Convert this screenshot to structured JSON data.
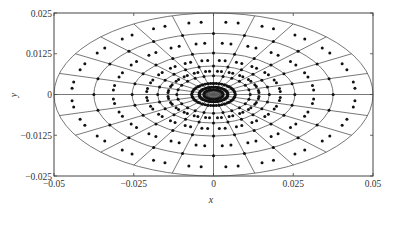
{
  "chart_data": {
    "type": "scatter",
    "title": "",
    "xlabel": "x",
    "ylabel": "y",
    "xlim": [
      -0.05,
      0.05
    ],
    "ylim": [
      -0.025,
      0.025
    ],
    "xticks": [
      -0.05,
      -0.025,
      0,
      0.025,
      0.05
    ],
    "xtick_labels": [
      "-0.05",
      "-0.025",
      "0",
      "0.025",
      "0.05"
    ],
    "yticks": [
      -0.025,
      -0.0125,
      0,
      0.0125,
      0.025
    ],
    "ytick_labels": [
      "-0.025",
      "-0.0125",
      "0",
      "0.0125",
      "0.025"
    ],
    "grid": false,
    "legend": null,
    "ellipse_semi_axes_x": [
      0.05,
      0.0375,
      0.0255,
      0.0175,
      0.0115,
      0.0068,
      0.0045,
      0.003
    ],
    "axis_ratio_b_over_a": 0.5,
    "radial_line_angles_deg": [
      0,
      15,
      30,
      45,
      60,
      75,
      90,
      105,
      120,
      135,
      150,
      165,
      180,
      195,
      210,
      225,
      240,
      255,
      270,
      285,
      300,
      315,
      330,
      345
    ],
    "node_rings_x": [
      0.0375,
      0.0255,
      0.0175,
      0.0115,
      0.0068,
      0.0045,
      0.003
    ],
    "midpoint_rings_x": [
      0.0445,
      0.0315,
      0.021,
      0.0143
    ],
    "colors": {
      "line": "#555555",
      "dot": "#111111",
      "axis": "#444444",
      "inner_fill": "#999999"
    }
  }
}
